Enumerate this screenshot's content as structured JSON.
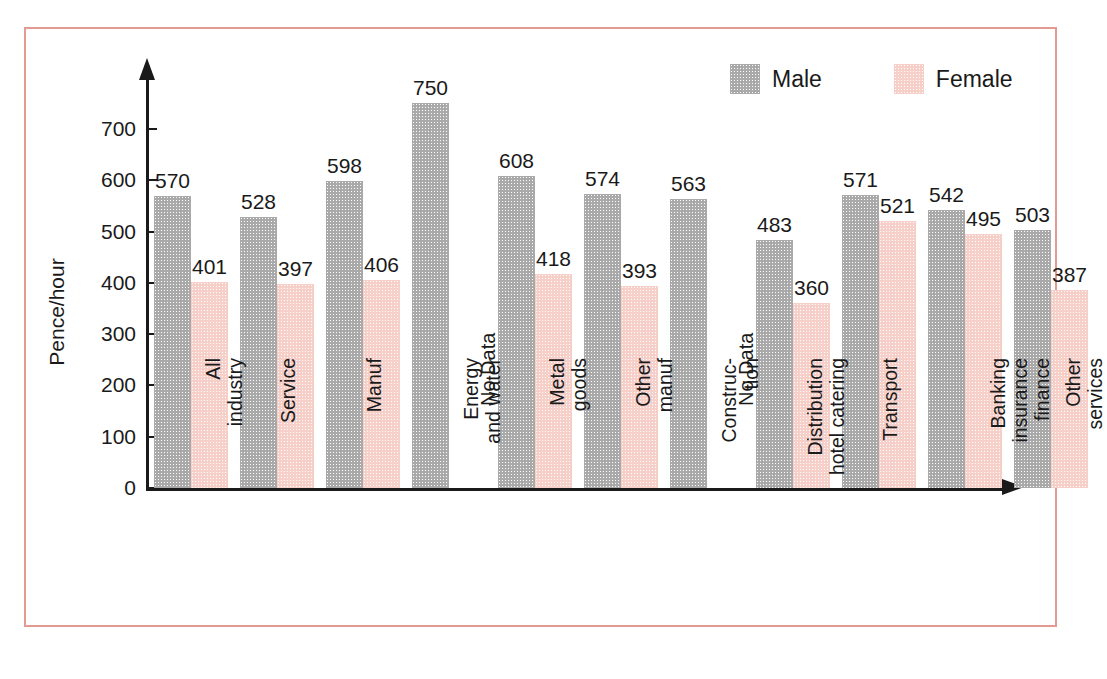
{
  "chart_data": {
    "type": "bar",
    "title": "",
    "xlabel": "",
    "ylabel": "Pence/hour",
    "ylim": [
      0,
      780
    ],
    "yticks": [
      0,
      100,
      200,
      300,
      400,
      500,
      600,
      700
    ],
    "grid": false,
    "legend_position": "top-right",
    "no_data_text": "No Data",
    "categories": [
      "All\nindustry",
      "Service",
      "Manuf",
      "Energy\nand water",
      "Metal\ngoods",
      "Other\nmanuf",
      "Construc-\ntion",
      "Distribution\nhotel catering",
      "Transport",
      "Banking\ninsurance\nfinance",
      "Other\nservices"
    ],
    "series": [
      {
        "name": "Male",
        "color": "#a9a9a9",
        "values": [
          570,
          528,
          598,
          750,
          608,
          574,
          563,
          483,
          571,
          542,
          503
        ]
      },
      {
        "name": "Female",
        "color": "#f6cfc9",
        "values": [
          401,
          397,
          406,
          null,
          418,
          393,
          null,
          360,
          521,
          495,
          387
        ]
      }
    ]
  },
  "legend": {
    "items": [
      {
        "label": "Male",
        "color": "#a9a9a9"
      },
      {
        "label": "Female",
        "color": "#f6cfc9"
      }
    ]
  },
  "frame": {
    "border_color": "#e39a93"
  }
}
